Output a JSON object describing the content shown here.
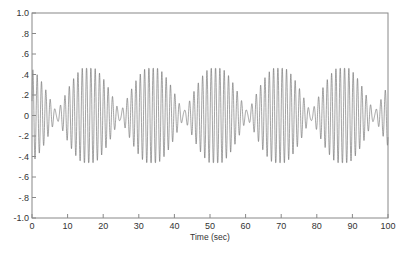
{
  "chart_data": {
    "type": "line",
    "title": "",
    "xlabel": "Time (sec)",
    "ylabel": "",
    "xlim": [
      0,
      100
    ],
    "ylim": [
      -1.0,
      1.0
    ],
    "x_ticks": [
      0,
      10,
      20,
      30,
      40,
      50,
      60,
      70,
      80,
      90,
      100
    ],
    "x_tick_labels": [
      "0",
      "10",
      "20",
      "30",
      "40",
      "50",
      "60",
      "70",
      "80",
      "90",
      "100"
    ],
    "y_ticks": [
      1.0,
      0.8,
      0.6,
      0.4,
      0.2,
      0,
      -0.2,
      -0.4,
      -0.6,
      -0.8,
      -1.0
    ],
    "y_tick_labels": [
      "1.0",
      ".8",
      ".6",
      ".4",
      ".2",
      "0",
      "-.2",
      "-.4",
      "-.6",
      "-.8",
      "-1.0"
    ],
    "grid": false,
    "legend": null,
    "series": [
      {
        "name": "signal",
        "description": "Dense oscillation with constant amplitude envelope between approximately +0.46 and -0.46 across 0-100 sec, approx 0.8 Hz with beating pattern",
        "amplitude": 0.46,
        "frequency_hz": 0.8,
        "x_range": [
          0,
          100
        ],
        "color": "#666666"
      }
    ]
  }
}
